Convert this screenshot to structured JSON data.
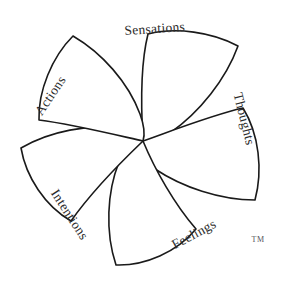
{
  "figure": {
    "background_color": "#ffffff",
    "stroke_color": "#1a1a1a",
    "text_color": "#2b2b2b",
    "center": {
      "x": 143,
      "y": 141
    },
    "radius": 124,
    "petal_count": 5
  },
  "petals": [
    {
      "id": "sensations",
      "label": "Sensations",
      "label_x": 155,
      "label_y": 33,
      "label_rotation": -4,
      "anchor": "middle"
    },
    {
      "id": "thoughts",
      "label": "Thoughts",
      "label_x": 240,
      "label_y": 120,
      "label_rotation": 76,
      "anchor": "middle"
    },
    {
      "id": "feelings",
      "label": "Feelings",
      "label_x": 196,
      "label_y": 238,
      "label_rotation": -28,
      "anchor": "middle"
    },
    {
      "id": "intentions",
      "label": "Intentions",
      "label_x": 66,
      "label_y": 217,
      "label_rotation": 57,
      "anchor": "middle"
    },
    {
      "id": "actions",
      "label": "Actions",
      "label_x": 54,
      "label_y": 98,
      "label_rotation": -56,
      "anchor": "middle"
    }
  ],
  "trademark": {
    "label": "TM",
    "x": 258,
    "y": 242
  }
}
